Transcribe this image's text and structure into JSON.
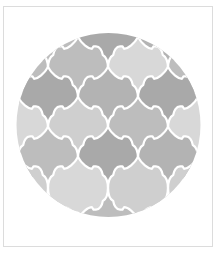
{
  "image": {
    "description": "Circular swatch of moroccan lantern (arabesque) tile pattern in shades of gray with white grout lines",
    "grout_color": "#ffffff",
    "frame_border_color": "#dcdcdc",
    "palette": {
      "dark": "#a9a9a9",
      "middark": "#b3b3b3",
      "mid": "#bdbdbd",
      "light": "#cfcfcf",
      "lightest": "#d8d8d8"
    },
    "tiles": [
      {
        "row": 0,
        "col": 0,
        "shade": "mid"
      },
      {
        "row": 0,
        "col": 1,
        "shade": "mid"
      },
      {
        "row": 0,
        "col": 2,
        "shade": "light"
      },
      {
        "row": 0,
        "col": 3,
        "shade": "mid"
      },
      {
        "row": 1,
        "col": 0,
        "shade": "mid"
      },
      {
        "row": 1,
        "col": 1,
        "shade": "dark"
      },
      {
        "row": 1,
        "col": 2,
        "shade": "middark"
      },
      {
        "row": 1,
        "col": 3,
        "shade": "dark"
      },
      {
        "row": 2,
        "col": 0,
        "shade": "mid"
      },
      {
        "row": 2,
        "col": 1,
        "shade": "mid"
      },
      {
        "row": 2,
        "col": 2,
        "shade": "lightest"
      },
      {
        "row": 2,
        "col": 3,
        "shade": "mid"
      },
      {
        "row": 3,
        "col": 0,
        "shade": "dark"
      },
      {
        "row": 3,
        "col": 1,
        "shade": "middark"
      },
      {
        "row": 3,
        "col": 2,
        "shade": "dark"
      },
      {
        "row": 3,
        "col": 3,
        "shade": "mid"
      },
      {
        "row": 4,
        "col": 0,
        "shade": "lightest"
      },
      {
        "row": 4,
        "col": 1,
        "shade": "light"
      },
      {
        "row": 4,
        "col": 2,
        "shade": "mid"
      },
      {
        "row": 4,
        "col": 3,
        "shade": "lightest"
      },
      {
        "row": 5,
        "col": 0,
        "shade": "mid"
      },
      {
        "row": 5,
        "col": 1,
        "shade": "dark"
      },
      {
        "row": 5,
        "col": 2,
        "shade": "middark"
      },
      {
        "row": 5,
        "col": 3,
        "shade": "mid"
      },
      {
        "row": 6,
        "col": 0,
        "shade": "light"
      },
      {
        "row": 6,
        "col": 1,
        "shade": "lightest"
      },
      {
        "row": 6,
        "col": 2,
        "shade": "light"
      },
      {
        "row": 6,
        "col": 3,
        "shade": "light"
      }
    ]
  }
}
